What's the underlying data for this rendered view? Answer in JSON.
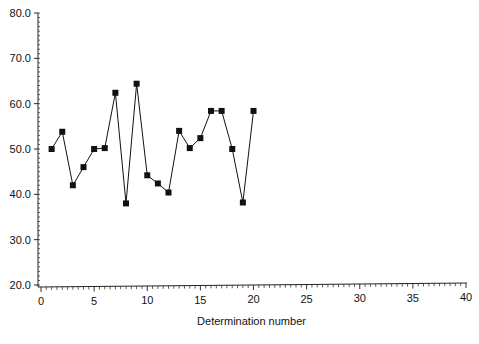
{
  "chart_data": {
    "type": "line",
    "title": "",
    "xlabel": "Determination number",
    "ylabel": "",
    "xlim": [
      0,
      40
    ],
    "ylim": [
      20,
      80
    ],
    "x_ticks": [
      0,
      5,
      10,
      15,
      20,
      25,
      30,
      35,
      40
    ],
    "x_tick_labels": [
      "0",
      "5",
      "10",
      "15",
      "20",
      "25",
      "30",
      "35",
      "40"
    ],
    "y_ticks": [
      20,
      30,
      40,
      50,
      60,
      70,
      80
    ],
    "y_tick_labels": [
      "20.0",
      "30.0",
      "40.0",
      "50.0",
      "60.0",
      "70.0",
      "80.0"
    ],
    "grid": false,
    "legend": null,
    "marker": "square",
    "series": [
      {
        "name": "Determinations",
        "x": [
          1,
          2,
          3,
          4,
          5,
          6,
          7,
          8,
          9,
          10,
          11,
          12,
          13,
          14,
          15,
          16,
          17,
          18,
          19,
          20
        ],
        "values": [
          50.0,
          53.8,
          42.0,
          46.0,
          50.0,
          50.2,
          62.4,
          38.0,
          64.4,
          44.2,
          42.4,
          40.4,
          54.0,
          50.2,
          52.4,
          58.4,
          58.4,
          50.0,
          38.2,
          58.4
        ],
        "color": "#111111"
      }
    ]
  }
}
